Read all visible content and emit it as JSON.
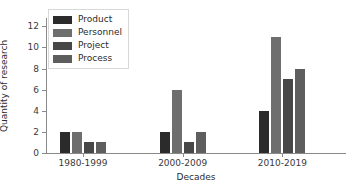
{
  "chart_data": {
    "type": "bar",
    "title": "",
    "xlabel": "Decades",
    "ylabel": "Quantity of research",
    "categories": [
      "1980-1999",
      "2000-2009",
      "2010-2019"
    ],
    "series": [
      {
        "name": "Product",
        "values": [
          2,
          2,
          4
        ],
        "color": "#2b2b2b"
      },
      {
        "name": "Personnel",
        "values": [
          2,
          6,
          11
        ],
        "color": "#6e6e6e"
      },
      {
        "name": "Project",
        "values": [
          1,
          1,
          7
        ],
        "color": "#474747"
      },
      {
        "name": "Process",
        "values": [
          1,
          2,
          8
        ],
        "color": "#5e5e5e"
      }
    ],
    "ylim": [
      0,
      12.6
    ],
    "yticks": [
      0,
      2,
      4,
      6,
      8,
      10,
      12
    ],
    "ytick_labels": [
      "0",
      "2",
      "4",
      "6",
      "8",
      "10",
      "12"
    ],
    "grid": false,
    "legend_position": "upper left",
    "legend_entries": [
      "Product",
      "Personnel",
      "Project",
      "Process"
    ]
  }
}
